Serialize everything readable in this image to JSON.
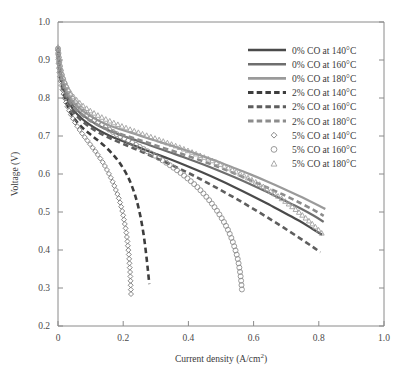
{
  "chart_data": {
    "type": "line",
    "title": "",
    "xlabel": "Current density (A/cm",
    "xlabel_sup": "2",
    "xlabel_tail": ")",
    "ylabel": "Voltage (V)",
    "xlim": [
      0,
      1.0
    ],
    "ylim": [
      0.2,
      1.0
    ],
    "xticks": [
      0,
      0.2,
      0.4,
      0.6,
      0.8,
      1.0
    ],
    "xtick_labels": [
      "0",
      "0.2",
      "0.4",
      "0.6",
      "0.8",
      "1.0"
    ],
    "yticks": [
      0.2,
      0.3,
      0.4,
      0.5,
      0.6,
      0.7,
      0.8,
      0.9,
      1.0
    ],
    "ytick_labels": [
      "0.2",
      "0.3",
      "0.4",
      "0.5",
      "0.6",
      "0.7",
      "0.8",
      "0.9",
      "1.0"
    ],
    "grid": false,
    "legend_position": "upper-right",
    "series": [
      {
        "name": "0% CO at 140°C",
        "style": "solid",
        "color": "#4a4a4a",
        "width": 2.2,
        "marker": "none",
        "points": [
          [
            0.0,
            0.93
          ],
          [
            0.005,
            0.88
          ],
          [
            0.012,
            0.845
          ],
          [
            0.022,
            0.812
          ],
          [
            0.035,
            0.786
          ],
          [
            0.05,
            0.766
          ],
          [
            0.07,
            0.748
          ],
          [
            0.095,
            0.731
          ],
          [
            0.125,
            0.715
          ],
          [
            0.16,
            0.7
          ],
          [
            0.2,
            0.686
          ],
          [
            0.245,
            0.671
          ],
          [
            0.29,
            0.656
          ],
          [
            0.34,
            0.64
          ],
          [
            0.39,
            0.623
          ],
          [
            0.44,
            0.605
          ],
          [
            0.49,
            0.586
          ],
          [
            0.54,
            0.566
          ],
          [
            0.59,
            0.545
          ],
          [
            0.64,
            0.523
          ],
          [
            0.69,
            0.5
          ],
          [
            0.74,
            0.477
          ],
          [
            0.78,
            0.456
          ],
          [
            0.81,
            0.44
          ]
        ]
      },
      {
        "name": "0% CO at 160°C",
        "style": "solid",
        "color": "#6e6e6e",
        "width": 2.2,
        "marker": "none",
        "points": [
          [
            0.0,
            0.932
          ],
          [
            0.005,
            0.886
          ],
          [
            0.012,
            0.852
          ],
          [
            0.022,
            0.82
          ],
          [
            0.035,
            0.795
          ],
          [
            0.05,
            0.776
          ],
          [
            0.07,
            0.759
          ],
          [
            0.095,
            0.743
          ],
          [
            0.125,
            0.727
          ],
          [
            0.16,
            0.713
          ],
          [
            0.2,
            0.7
          ],
          [
            0.245,
            0.687
          ],
          [
            0.29,
            0.673
          ],
          [
            0.34,
            0.658
          ],
          [
            0.39,
            0.643
          ],
          [
            0.44,
            0.627
          ],
          [
            0.49,
            0.61
          ],
          [
            0.54,
            0.592
          ],
          [
            0.59,
            0.573
          ],
          [
            0.64,
            0.553
          ],
          [
            0.69,
            0.532
          ],
          [
            0.74,
            0.511
          ],
          [
            0.785,
            0.49
          ],
          [
            0.815,
            0.474
          ]
        ]
      },
      {
        "name": "0% CO at 180°C",
        "style": "solid",
        "color": "#9a9a9a",
        "width": 2.2,
        "marker": "none",
        "points": [
          [
            0.0,
            0.934
          ],
          [
            0.005,
            0.89
          ],
          [
            0.012,
            0.858
          ],
          [
            0.022,
            0.828
          ],
          [
            0.035,
            0.804
          ],
          [
            0.05,
            0.786
          ],
          [
            0.07,
            0.77
          ],
          [
            0.095,
            0.755
          ],
          [
            0.125,
            0.74
          ],
          [
            0.16,
            0.727
          ],
          [
            0.2,
            0.715
          ],
          [
            0.245,
            0.703
          ],
          [
            0.29,
            0.69
          ],
          [
            0.34,
            0.677
          ],
          [
            0.39,
            0.663
          ],
          [
            0.44,
            0.648
          ],
          [
            0.49,
            0.633
          ],
          [
            0.54,
            0.616
          ],
          [
            0.59,
            0.599
          ],
          [
            0.64,
            0.581
          ],
          [
            0.69,
            0.562
          ],
          [
            0.74,
            0.542
          ],
          [
            0.79,
            0.521
          ],
          [
            0.82,
            0.508
          ]
        ]
      },
      {
        "name": "2% CO at 140°C",
        "style": "dashed",
        "color": "#3d3d3d",
        "width": 2.6,
        "marker": "none",
        "points": [
          [
            0.0,
            0.928
          ],
          [
            0.005,
            0.872
          ],
          [
            0.012,
            0.832
          ],
          [
            0.022,
            0.796
          ],
          [
            0.035,
            0.768
          ],
          [
            0.05,
            0.746
          ],
          [
            0.07,
            0.726
          ],
          [
            0.095,
            0.707
          ],
          [
            0.12,
            0.69
          ],
          [
            0.145,
            0.672
          ],
          [
            0.17,
            0.65
          ],
          [
            0.19,
            0.628
          ],
          [
            0.21,
            0.6
          ],
          [
            0.225,
            0.572
          ],
          [
            0.24,
            0.534
          ],
          [
            0.252,
            0.492
          ],
          [
            0.262,
            0.444
          ],
          [
            0.27,
            0.392
          ],
          [
            0.276,
            0.345
          ],
          [
            0.28,
            0.31
          ]
        ]
      },
      {
        "name": "2% CO at 160°C",
        "style": "dashed",
        "color": "#5e5e5e",
        "width": 2.6,
        "marker": "none",
        "points": [
          [
            0.0,
            0.93
          ],
          [
            0.005,
            0.878
          ],
          [
            0.012,
            0.84
          ],
          [
            0.022,
            0.806
          ],
          [
            0.035,
            0.78
          ],
          [
            0.05,
            0.76
          ],
          [
            0.07,
            0.742
          ],
          [
            0.095,
            0.725
          ],
          [
            0.125,
            0.709
          ],
          [
            0.16,
            0.694
          ],
          [
            0.2,
            0.679
          ],
          [
            0.245,
            0.663
          ],
          [
            0.29,
            0.646
          ],
          [
            0.34,
            0.627
          ],
          [
            0.39,
            0.607
          ],
          [
            0.44,
            0.585
          ],
          [
            0.49,
            0.562
          ],
          [
            0.54,
            0.538
          ],
          [
            0.59,
            0.513
          ],
          [
            0.64,
            0.487
          ],
          [
            0.69,
            0.46
          ],
          [
            0.74,
            0.432
          ],
          [
            0.78,
            0.409
          ],
          [
            0.805,
            0.394
          ]
        ]
      },
      {
        "name": "2% CO at 180°C",
        "style": "dashed",
        "color": "#8c8c8c",
        "width": 2.6,
        "marker": "none",
        "points": [
          [
            0.0,
            0.933
          ],
          [
            0.005,
            0.884
          ],
          [
            0.012,
            0.848
          ],
          [
            0.022,
            0.816
          ],
          [
            0.035,
            0.792
          ],
          [
            0.05,
            0.773
          ],
          [
            0.07,
            0.757
          ],
          [
            0.095,
            0.742
          ],
          [
            0.125,
            0.728
          ],
          [
            0.16,
            0.715
          ],
          [
            0.2,
            0.703
          ],
          [
            0.245,
            0.691
          ],
          [
            0.29,
            0.678
          ],
          [
            0.34,
            0.664
          ],
          [
            0.39,
            0.65
          ],
          [
            0.44,
            0.635
          ],
          [
            0.49,
            0.619
          ],
          [
            0.54,
            0.602
          ],
          [
            0.59,
            0.584
          ],
          [
            0.64,
            0.565
          ],
          [
            0.69,
            0.546
          ],
          [
            0.74,
            0.525
          ],
          [
            0.785,
            0.505
          ],
          [
            0.815,
            0.49
          ]
        ]
      },
      {
        "name": "5% CO at 140°C",
        "style": "markers",
        "color": "#7a7a7a",
        "width": 1,
        "marker": "diamond",
        "points": [
          [
            0.0,
            0.925
          ],
          [
            0.003,
            0.88
          ],
          [
            0.008,
            0.848
          ],
          [
            0.014,
            0.82
          ],
          [
            0.022,
            0.795
          ],
          [
            0.031,
            0.773
          ],
          [
            0.041,
            0.754
          ],
          [
            0.052,
            0.736
          ],
          [
            0.064,
            0.719
          ],
          [
            0.077,
            0.703
          ],
          [
            0.09,
            0.688
          ],
          [
            0.103,
            0.673
          ],
          [
            0.116,
            0.658
          ],
          [
            0.128,
            0.643
          ],
          [
            0.14,
            0.627
          ],
          [
            0.15,
            0.611
          ],
          [
            0.16,
            0.594
          ],
          [
            0.169,
            0.577
          ],
          [
            0.177,
            0.559
          ],
          [
            0.185,
            0.54
          ],
          [
            0.192,
            0.52
          ],
          [
            0.198,
            0.499
          ],
          [
            0.203,
            0.477
          ],
          [
            0.208,
            0.454
          ],
          [
            0.212,
            0.43
          ],
          [
            0.215,
            0.406
          ],
          [
            0.218,
            0.381
          ],
          [
            0.22,
            0.355
          ],
          [
            0.222,
            0.33
          ],
          [
            0.223,
            0.305
          ],
          [
            0.224,
            0.283
          ]
        ]
      },
      {
        "name": "5% CO at 160°C",
        "style": "markers",
        "color": "#8f8f8f",
        "width": 1,
        "marker": "circle",
        "points": [
          [
            0.0,
            0.93
          ],
          [
            0.004,
            0.893
          ],
          [
            0.01,
            0.866
          ],
          [
            0.018,
            0.843
          ],
          [
            0.028,
            0.822
          ],
          [
            0.04,
            0.803
          ],
          [
            0.055,
            0.786
          ],
          [
            0.072,
            0.77
          ],
          [
            0.092,
            0.755
          ],
          [
            0.114,
            0.741
          ],
          [
            0.138,
            0.727
          ],
          [
            0.164,
            0.713
          ],
          [
            0.192,
            0.699
          ],
          [
            0.222,
            0.685
          ],
          [
            0.253,
            0.67
          ],
          [
            0.284,
            0.655
          ],
          [
            0.315,
            0.639
          ],
          [
            0.345,
            0.622
          ],
          [
            0.374,
            0.604
          ],
          [
            0.402,
            0.585
          ],
          [
            0.428,
            0.565
          ],
          [
            0.452,
            0.543
          ],
          [
            0.474,
            0.52
          ],
          [
            0.494,
            0.495
          ],
          [
            0.512,
            0.469
          ],
          [
            0.527,
            0.442
          ],
          [
            0.539,
            0.414
          ],
          [
            0.549,
            0.385
          ],
          [
            0.556,
            0.355
          ],
          [
            0.561,
            0.325
          ],
          [
            0.564,
            0.297
          ],
          [
            0.566,
            0.288
          ]
        ]
      },
      {
        "name": "5% CO at 180°C",
        "style": "markers",
        "color": "#a2a2a2",
        "width": 1,
        "marker": "triangle",
        "points": [
          [
            0.0,
            0.934
          ],
          [
            0.004,
            0.898
          ],
          [
            0.01,
            0.872
          ],
          [
            0.018,
            0.85
          ],
          [
            0.028,
            0.83
          ],
          [
            0.04,
            0.812
          ],
          [
            0.056,
            0.796
          ],
          [
            0.075,
            0.781
          ],
          [
            0.098,
            0.767
          ],
          [
            0.124,
            0.754
          ],
          [
            0.153,
            0.742
          ],
          [
            0.185,
            0.73
          ],
          [
            0.22,
            0.718
          ],
          [
            0.258,
            0.706
          ],
          [
            0.298,
            0.694
          ],
          [
            0.34,
            0.681
          ],
          [
            0.383,
            0.667
          ],
          [
            0.427,
            0.652
          ],
          [
            0.471,
            0.636
          ],
          [
            0.515,
            0.619
          ],
          [
            0.558,
            0.601
          ],
          [
            0.6,
            0.582
          ],
          [
            0.641,
            0.561
          ],
          [
            0.68,
            0.539
          ],
          [
            0.716,
            0.516
          ],
          [
            0.748,
            0.493
          ],
          [
            0.776,
            0.472
          ],
          [
            0.798,
            0.454
          ],
          [
            0.812,
            0.442
          ]
        ]
      }
    ]
  },
  "legend": {
    "items": [
      {
        "label": "0% CO at 140°C",
        "style": "solid",
        "color": "#4a4a4a",
        "marker": "none"
      },
      {
        "label": "0% CO at 160°C",
        "style": "solid",
        "color": "#6e6e6e",
        "marker": "none"
      },
      {
        "label": "0% CO at 180°C",
        "style": "solid",
        "color": "#9a9a9a",
        "marker": "none"
      },
      {
        "label": "2% CO at 140°C",
        "style": "dashed",
        "color": "#3d3d3d",
        "marker": "none"
      },
      {
        "label": "2% CO at 160°C",
        "style": "dashed",
        "color": "#5e5e5e",
        "marker": "none"
      },
      {
        "label": "2% CO at 180°C",
        "style": "dashed",
        "color": "#8c8c8c",
        "marker": "none"
      },
      {
        "label": "5% CO at 140°C",
        "style": "markers",
        "color": "#7a7a7a",
        "marker": "diamond"
      },
      {
        "label": "5% CO at 160°C",
        "style": "markers",
        "color": "#8f8f8f",
        "marker": "circle"
      },
      {
        "label": "5% CO at 180°C",
        "style": "markers",
        "color": "#a2a2a2",
        "marker": "triangle"
      }
    ]
  },
  "colors": {
    "axis": "#8a8a8a",
    "text": "#3a3a3a",
    "background": "#ffffff"
  }
}
